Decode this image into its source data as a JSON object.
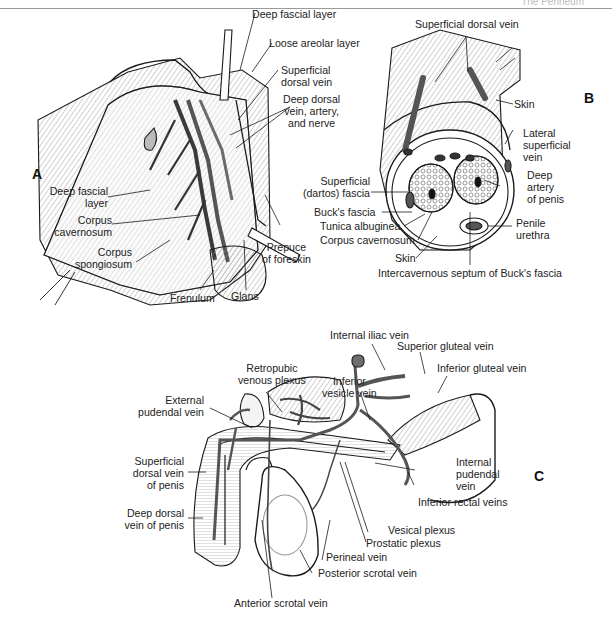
{
  "page_header": {
    "title": "The Perineum",
    "page_number": ""
  },
  "panels": {
    "A": {
      "letter": "A",
      "labels": {
        "deep_fascial_layer_top": "Deep fascial layer",
        "loose_areolar_layer": "Loose areolar layer",
        "superficial_dorsal_vein_1": "Superficial",
        "superficial_dorsal_vein_2": "dorsal vein",
        "deep_dorsal_1": "Deep dorsal",
        "deep_dorsal_2": "vein, artery,",
        "deep_dorsal_3": "and nerve",
        "deep_fascial_layer_1": "Deep fascial",
        "deep_fascial_layer_2": "layer",
        "corpus_cavernosum_1": "Corpus",
        "corpus_cavernosum_2": "cavernosum",
        "corpus_spongiosum_1": "Corpus",
        "corpus_spongiosum_2": "spongiosum",
        "prepuce_1": "Prepuce",
        "prepuce_2": "of foreskin",
        "frenulum": "Frenulum",
        "glans": "Glans"
      }
    },
    "B": {
      "letter": "B",
      "labels": {
        "superficial_dorsal_vein": "Superficial dorsal vein",
        "skin_top": "Skin",
        "lateral_superficial_1": "Lateral",
        "lateral_superficial_2": "superficial",
        "lateral_superficial_3": "vein",
        "superficial_dartos_1": "Superficial",
        "superficial_dartos_2": "(dartos) fascia",
        "deep_artery_1": "Deep",
        "deep_artery_2": "artery",
        "deep_artery_3": "of penis",
        "bucks_fascia": "Buck's fascia",
        "tunica_albuginea": "Tunica albuginea",
        "penile_urethra_1": "Penile",
        "penile_urethra_2": "urethra",
        "corpus_cavernosum": "Corpus cavernosum",
        "skin_bottom": "Skin",
        "intercavernous_septum": "Intercavernous septum of Buck's fascia"
      }
    },
    "C": {
      "letter": "C",
      "labels": {
        "internal_iliac_vein": "Internal iliac vein",
        "superior_gluteal_vein": "Superior gluteal vein",
        "inferior_gluteal_vein": "Inferior gluteal vein",
        "retropubic_1": "Retropubic",
        "retropubic_2": "venous plexus",
        "inferior_vesicle_1": "Inferior",
        "inferior_vesicle_2": "vesicle vein",
        "external_pudendal_1": "External",
        "external_pudendal_2": "pudendal vein",
        "superficial_dorsal_penis_1": "Superficial",
        "superficial_dorsal_penis_2": "dorsal vein",
        "superficial_dorsal_penis_3": "of penis",
        "internal_pudendal_1": "Internal",
        "internal_pudendal_2": "pudendal",
        "internal_pudendal_3": "vein",
        "deep_dorsal_penis_1": "Deep dorsal",
        "deep_dorsal_penis_2": "vein of penis",
        "inferior_rectal_veins": "Inferior rectal veins",
        "vesical_plexus": "Vesical plexus",
        "prostatic_plexus": "Prostatic plexus",
        "perineal_vein": "Perineal vein",
        "posterior_scrotal_vein": "Posterior scrotal vein",
        "anterior_scrotal_vein": "Anterior scrotal vein"
      }
    }
  },
  "colors": {
    "ink": "#1a1a1a",
    "vein_fill": "#6e6e6e",
    "hatch": "#9a9a9a",
    "background": "#ffffff"
  }
}
